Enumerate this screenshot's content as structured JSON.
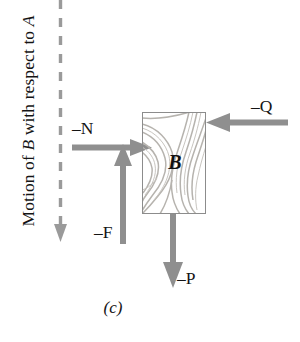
{
  "figure": {
    "caption": "(c)",
    "motion_label": {
      "prefix": "Motion of ",
      "body_italic": "B",
      "middle": " with respect to ",
      "ref_italic": "A",
      "full_text": "Motion of B with respect to A"
    },
    "block": {
      "label": "B",
      "fill_color": "#dedcd9",
      "border_color": "#8c8c8c",
      "grain_color": "#b9b6b1"
    },
    "motion_arrow": {
      "name": "motion-direction-dashed-arrow",
      "direction": "down",
      "style": "dashed",
      "color": "#9a9a9a"
    },
    "forces": [
      {
        "id": "N",
        "label": "–N",
        "direction": "right",
        "color": "#8f8f8f"
      },
      {
        "id": "Q",
        "label": "–Q",
        "direction": "left",
        "color": "#8f8f8f"
      },
      {
        "id": "F",
        "label": "–F",
        "direction": "up",
        "color": "#8f8f8f"
      },
      {
        "id": "P",
        "label": "–P",
        "direction": "down",
        "color": "#8f8f8f"
      }
    ]
  }
}
